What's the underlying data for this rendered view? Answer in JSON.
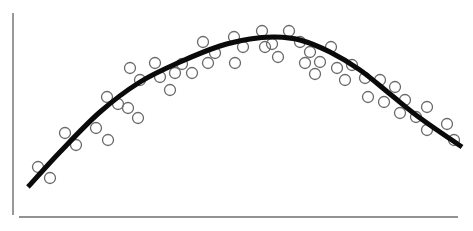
{
  "chart_data": {
    "type": "scatter",
    "title": "",
    "xlabel": "",
    "ylabel": "",
    "grid": false,
    "legend": null,
    "axes": {
      "y_axis": {
        "x": 13,
        "y1": 13,
        "y2": 215
      },
      "x_axis": {
        "y": 217,
        "x1": 19,
        "x2": 458
      }
    },
    "series": [
      {
        "name": "observations",
        "kind": "scatter",
        "marker": "open-circle",
        "marker_radius": 5.5,
        "color": "#6a6a6a",
        "points_px": [
          [
            38,
            167
          ],
          [
            50,
            178
          ],
          [
            65,
            133
          ],
          [
            76,
            145
          ],
          [
            96,
            128
          ],
          [
            107,
            97
          ],
          [
            108,
            140
          ],
          [
            118,
            104
          ],
          [
            128,
            108
          ],
          [
            130,
            68
          ],
          [
            138,
            118
          ],
          [
            140,
            80
          ],
          [
            155,
            63
          ],
          [
            160,
            77
          ],
          [
            170,
            90
          ],
          [
            175,
            73
          ],
          [
            182,
            64
          ],
          [
            192,
            73
          ],
          [
            203,
            42
          ],
          [
            208,
            63
          ],
          [
            215,
            53
          ],
          [
            234,
            37
          ],
          [
            235,
            63
          ],
          [
            243,
            47
          ],
          [
            262,
            31
          ],
          [
            265,
            47
          ],
          [
            272,
            44
          ],
          [
            278,
            57
          ],
          [
            289,
            31
          ],
          [
            300,
            42
          ],
          [
            305,
            63
          ],
          [
            310,
            52
          ],
          [
            315,
            74
          ],
          [
            320,
            62
          ],
          [
            331,
            47
          ],
          [
            337,
            68
          ],
          [
            345,
            80
          ],
          [
            352,
            65
          ],
          [
            365,
            78
          ],
          [
            368,
            97
          ],
          [
            380,
            80
          ],
          [
            384,
            102
          ],
          [
            395,
            87
          ],
          [
            400,
            113
          ],
          [
            405,
            100
          ],
          [
            416,
            117
          ],
          [
            427,
            107
          ],
          [
            427,
            130
          ],
          [
            447,
            124
          ],
          [
            454,
            140
          ]
        ]
      },
      {
        "name": "fitted curve",
        "kind": "line",
        "color": "#0a0a0a",
        "width": 5,
        "points_px": [
          [
            28,
            187
          ],
          [
            60,
            152
          ],
          [
            100,
            112
          ],
          [
            140,
            82
          ],
          [
            180,
            62
          ],
          [
            220,
            46
          ],
          [
            250,
            39
          ],
          [
            275,
            37
          ],
          [
            300,
            40
          ],
          [
            330,
            52
          ],
          [
            360,
            70
          ],
          [
            390,
            94
          ],
          [
            420,
            118
          ],
          [
            462,
            147
          ]
        ]
      }
    ]
  }
}
